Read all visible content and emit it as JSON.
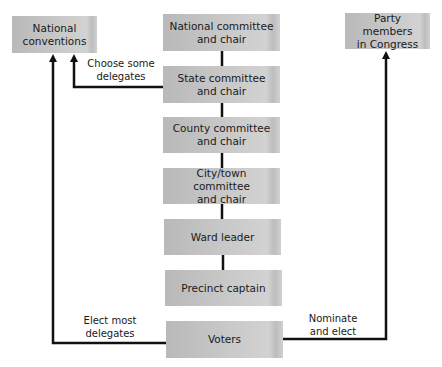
{
  "diagram": {
    "type": "party-organization-flowchart",
    "hierarchy": [
      {
        "id": "national-committee",
        "label": "National committee\nand chair"
      },
      {
        "id": "state-committee",
        "label": "State committee\nand chair"
      },
      {
        "id": "county-committee",
        "label": "County committee\nand chair"
      },
      {
        "id": "city-town-committee",
        "label": "City/town committee\nand chair"
      },
      {
        "id": "ward-leader",
        "label": "Ward leader"
      },
      {
        "id": "precinct-captain",
        "label": "Precinct captain"
      },
      {
        "id": "voters",
        "label": "Voters"
      }
    ],
    "side_nodes": {
      "national_conventions": "National\nconventions",
      "party_members": "Party members\nin Congress"
    },
    "edge_labels": {
      "choose_some": "Choose some\ndelegates",
      "elect_most": "Elect most\ndelegates",
      "nominate": "Nominate\nand elect"
    },
    "edges": [
      {
        "from": "state-committee",
        "to": "national-conventions",
        "label": "Choose some delegates"
      },
      {
        "from": "voters",
        "to": "national-conventions",
        "label": "Elect most delegates"
      },
      {
        "from": "voters",
        "to": "party-members-in-congress",
        "label": "Nominate and elect"
      }
    ]
  }
}
